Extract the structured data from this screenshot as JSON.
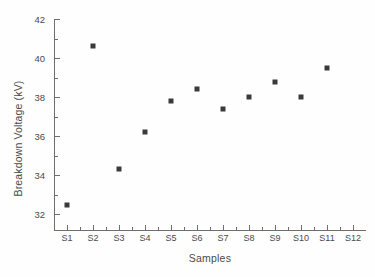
{
  "chart_data": {
    "type": "scatter",
    "title": "",
    "xlabel": "Samples",
    "ylabel": "Breakdown Voltage (kV)",
    "categories": [
      "S1",
      "S2",
      "S3",
      "S4",
      "S5",
      "S6",
      "S7",
      "S8",
      "S9",
      "S10",
      "S11",
      "S12"
    ],
    "values": [
      32.5,
      40.6,
      34.3,
      36.2,
      37.8,
      38.4,
      37.4,
      38.0,
      38.8,
      38.0,
      39.5,
      null
    ],
    "series": [
      {
        "name": "Breakdown Voltage",
        "values": [
          32.5,
          40.6,
          34.3,
          36.2,
          37.8,
          38.4,
          37.4,
          38.0,
          38.8,
          38.0,
          39.5,
          null
        ]
      }
    ],
    "ylim": [
      31.15,
      42.0
    ],
    "yticks": [
      32,
      34,
      36,
      38,
      40,
      42
    ],
    "ytick_labels": [
      "32",
      "34",
      "36",
      "38",
      "40",
      "42"
    ],
    "yminor_ticks": [
      33,
      35,
      37,
      39,
      41
    ],
    "xlim": [
      0.5,
      12.5
    ],
    "grid": false,
    "legend": false,
    "marker": "square",
    "marker_color": "#3a3a3a"
  },
  "axes": {
    "y_title": "Breakdown Voltage (kV)",
    "x_title": "Samples",
    "y_labels": [
      "42",
      "40",
      "38",
      "36",
      "34",
      "32"
    ],
    "x_labels": [
      "S1",
      "S2",
      "S3",
      "S4",
      "S5",
      "S6",
      "S7",
      "S8",
      "S9",
      "S10",
      "S11",
      "S12"
    ]
  },
  "colors": {
    "marker": "#3a3a3a",
    "axis": "#6e6e6e",
    "text": "#4a4a4a",
    "background": "#fefefe"
  }
}
